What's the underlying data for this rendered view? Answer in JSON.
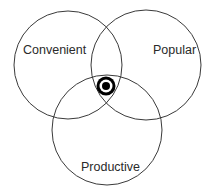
{
  "diagram": {
    "type": "venn",
    "sets": [
      {
        "label": "Convenient",
        "cx": 68,
        "cy": 65,
        "r": 54,
        "label_x": 15,
        "label_y": 52
      },
      {
        "label": "Popular",
        "cx": 146,
        "cy": 65,
        "r": 55,
        "label_x": 152,
        "label_y": 55
      },
      {
        "label": "Productive",
        "cx": 107,
        "cy": 130,
        "r": 55,
        "label_x": 81,
        "label_y": 170
      }
    ],
    "center_marker": {
      "name": "target",
      "cx": 106,
      "cy": 86
    },
    "stroke_color": "#3a3a3a",
    "marker_color": "#000000"
  }
}
